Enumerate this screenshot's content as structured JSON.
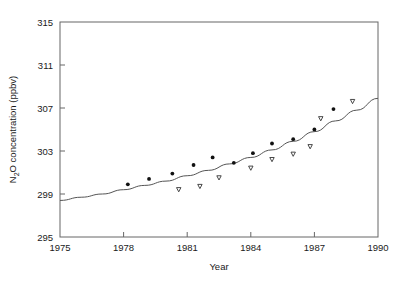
{
  "chart_data": {
    "type": "scatter",
    "title": "",
    "xlabel": "Year",
    "ylabel": "N2O concentration (ppbv)",
    "ylabel_parts": {
      "pre": "N",
      "sub": "2",
      "post": "O concentration (ppbv)"
    },
    "xlim": [
      1975,
      1990
    ],
    "ylim": [
      295,
      315
    ],
    "xticks": [
      1975,
      1978,
      1981,
      1984,
      1987,
      1990
    ],
    "yticks": [
      295,
      299,
      303,
      307,
      311,
      315
    ],
    "xtick_labels": [
      "1975",
      "1978",
      "1981",
      "1984",
      "1987",
      "1990"
    ],
    "ytick_labels": [
      "295",
      "299",
      "303",
      "307",
      "311",
      "315"
    ],
    "grid": false,
    "legend": "none",
    "series": [
      {
        "name": "filled-circles",
        "marker": "circle-filled",
        "color": "#111111",
        "points": [
          {
            "x": 1978.2,
            "y": 299.9
          },
          {
            "x": 1979.2,
            "y": 300.4
          },
          {
            "x": 1980.3,
            "y": 300.9
          },
          {
            "x": 1981.3,
            "y": 301.7
          },
          {
            "x": 1982.2,
            "y": 302.4
          },
          {
            "x": 1983.2,
            "y": 301.9
          },
          {
            "x": 1984.1,
            "y": 302.8
          },
          {
            "x": 1985.0,
            "y": 303.7
          },
          {
            "x": 1986.0,
            "y": 304.1
          },
          {
            "x": 1987.0,
            "y": 305.0
          },
          {
            "x": 1987.9,
            "y": 306.9
          }
        ]
      },
      {
        "name": "open-triangles",
        "marker": "triangle-down-open",
        "color": "#333333",
        "points": [
          {
            "x": 1980.6,
            "y": 299.4
          },
          {
            "x": 1981.6,
            "y": 299.7
          },
          {
            "x": 1982.5,
            "y": 300.5
          },
          {
            "x": 1984.0,
            "y": 301.4
          },
          {
            "x": 1985.0,
            "y": 302.2
          },
          {
            "x": 1986.0,
            "y": 302.7
          },
          {
            "x": 1986.8,
            "y": 303.4
          },
          {
            "x": 1987.3,
            "y": 306.0
          },
          {
            "x": 1988.8,
            "y": 307.6
          }
        ]
      }
    ],
    "fit_curve": {
      "name": "trend-curve",
      "color": "#555555",
      "points": [
        {
          "x": 1975.0,
          "y": 298.4
        },
        {
          "x": 1976.0,
          "y": 298.7
        },
        {
          "x": 1977.0,
          "y": 299.0
        },
        {
          "x": 1978.0,
          "y": 299.4
        },
        {
          "x": 1979.0,
          "y": 299.8
        },
        {
          "x": 1980.0,
          "y": 300.2
        },
        {
          "x": 1981.0,
          "y": 300.7
        },
        {
          "x": 1982.0,
          "y": 301.2
        },
        {
          "x": 1983.0,
          "y": 301.8
        },
        {
          "x": 1984.0,
          "y": 302.4
        },
        {
          "x": 1985.0,
          "y": 303.1
        },
        {
          "x": 1986.0,
          "y": 303.9
        },
        {
          "x": 1987.0,
          "y": 304.8
        },
        {
          "x": 1988.0,
          "y": 305.8
        },
        {
          "x": 1989.0,
          "y": 306.8
        },
        {
          "x": 1990.0,
          "y": 307.9
        }
      ]
    }
  }
}
